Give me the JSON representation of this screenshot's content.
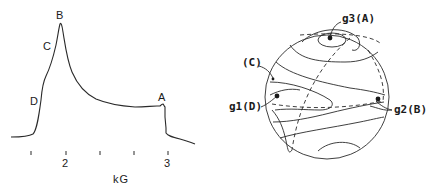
{
  "spectrum": {
    "peak_labels": {
      "A": "A",
      "B": "B",
      "C": "C",
      "D": "D"
    },
    "x_axis": {
      "label": "kG",
      "tick_labels": [
        "2",
        "3"
      ],
      "minor_ticks": 5
    }
  },
  "sphere": {
    "labels": {
      "g3": "g3(A)",
      "g1": "g1(D)",
      "g2": "g2(B)",
      "c": "(C)"
    }
  },
  "colors": {
    "line": "#2a2a2a",
    "background": "#ffffff"
  }
}
